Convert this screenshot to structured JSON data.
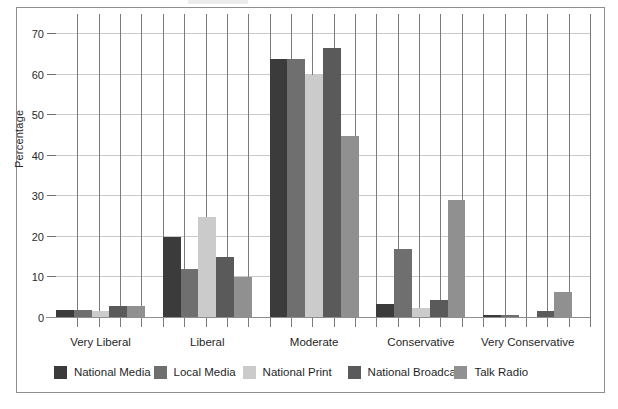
{
  "chart_data": {
    "type": "bar",
    "title": "",
    "xlabel": "",
    "ylabel": "Percentage",
    "ylim": [
      0,
      75
    ],
    "yticks": [
      0,
      10,
      20,
      30,
      40,
      50,
      60,
      70
    ],
    "ytick_labels": [
      "0",
      "10",
      "20",
      "30",
      "40",
      "50",
      "60",
      "70"
    ],
    "grid": true,
    "legend_position": "bottom",
    "categories": [
      "Very Liberal",
      "Liberal",
      "Moderate",
      "Conservative",
      "Very Conservative"
    ],
    "series": [
      {
        "name": "National Media",
        "color": "#3b3b3b",
        "values": [
          2.0,
          20.0,
          64.0,
          3.5,
          0.8
        ]
      },
      {
        "name": "Local Media",
        "color": "#6f6f6f",
        "values": [
          2.0,
          12.0,
          64.0,
          17.0,
          0.8
        ]
      },
      {
        "name": "National Print",
        "color": "#cbcbcb",
        "values": [
          1.8,
          24.8,
          60.0,
          2.5,
          0.2
        ]
      },
      {
        "name": "National Broadcast",
        "color": "#5a5a5a",
        "values": [
          3.0,
          15.0,
          66.5,
          4.5,
          1.8
        ]
      },
      {
        "name": "Talk Radio",
        "color": "#909090",
        "values": [
          3.0,
          10.0,
          45.0,
          29.0,
          6.5
        ]
      }
    ]
  },
  "legend": {
    "items": [
      {
        "label": "National Media"
      },
      {
        "label": "Local Media"
      },
      {
        "label": "National Print"
      },
      {
        "label": "National Broadcast"
      },
      {
        "label": "Talk Radio"
      }
    ]
  },
  "axis": {
    "y_title": "Percentage"
  }
}
